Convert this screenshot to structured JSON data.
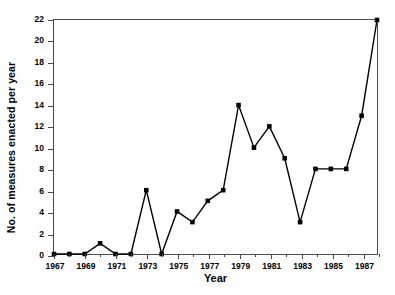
{
  "chart_data": {
    "type": "line",
    "title": "",
    "xlabel": "Year",
    "ylabel": "No. of measures enacted per year",
    "x": [
      1967,
      1968,
      1969,
      1970,
      1971,
      1972,
      1973,
      1974,
      1975,
      1976,
      1977,
      1978,
      1979,
      1980,
      1981,
      1982,
      1983,
      1984,
      1985,
      1986,
      1987,
      1988
    ],
    "values": [
      0,
      0,
      0,
      1,
      0,
      0,
      6,
      0,
      4,
      3,
      5,
      6,
      14,
      10,
      12,
      9,
      3,
      8,
      8,
      8,
      13,
      22
    ],
    "series": [
      {
        "name": "No. of measures enacted per year",
        "values": [
          0,
          0,
          0,
          1,
          0,
          0,
          6,
          0,
          4,
          3,
          5,
          6,
          14,
          10,
          12,
          9,
          3,
          8,
          8,
          8,
          13,
          22
        ]
      }
    ],
    "xlim": [
      1967,
      1988
    ],
    "ylim": [
      0,
      22
    ],
    "yticks": [
      0,
      2,
      4,
      6,
      8,
      10,
      12,
      14,
      16,
      18,
      20,
      22
    ],
    "ytick_labels": [
      "0",
      "2",
      "4",
      "6",
      "8",
      "10",
      "12",
      "14",
      "16",
      "18",
      "20",
      "22"
    ],
    "xticks_major": [
      1967,
      1969,
      1971,
      1973,
      1975,
      1977,
      1979,
      1981,
      1983,
      1985,
      1987
    ],
    "xtick_labels": [
      "1967",
      "1969",
      "1971",
      "1973",
      "1975",
      "1977",
      "1979",
      "1981",
      "1983",
      "1985",
      "1987"
    ],
    "xticks_minor": [
      1968,
      1970,
      1972,
      1974,
      1976,
      1978,
      1980,
      1982,
      1984,
      1986,
      1988
    ],
    "grid": false,
    "legend": false,
    "marker": "square",
    "line_color": "#000000",
    "marker_color": "#000000",
    "axis_color": "#4a4a4a",
    "background": "#ffffff"
  }
}
